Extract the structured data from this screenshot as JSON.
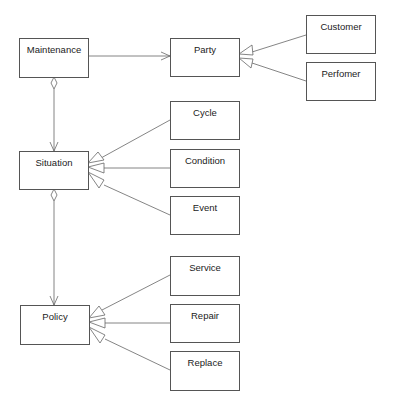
{
  "diagram": {
    "type": "UML class diagram",
    "classes": {
      "maintenance": {
        "label": "Maintenance"
      },
      "party": {
        "label": "Party"
      },
      "customer": {
        "label": "Customer"
      },
      "perfomer": {
        "label": "Perfomer"
      },
      "situation": {
        "label": "Situation"
      },
      "cycle": {
        "label": "Cycle"
      },
      "condition": {
        "label": "Condition"
      },
      "event": {
        "label": "Event"
      },
      "policy": {
        "label": "Policy"
      },
      "service": {
        "label": "Service"
      },
      "repair": {
        "label": "Repair"
      },
      "replace": {
        "label": "Replace"
      }
    },
    "relationships": [
      {
        "from": "Maintenance",
        "to": "Party",
        "kind": "association"
      },
      {
        "from": "Customer",
        "to": "Party",
        "kind": "generalization"
      },
      {
        "from": "Perfomer",
        "to": "Party",
        "kind": "generalization"
      },
      {
        "from": "Maintenance",
        "to": "Situation",
        "kind": "aggregation"
      },
      {
        "from": "Cycle",
        "to": "Situation",
        "kind": "generalization"
      },
      {
        "from": "Condition",
        "to": "Situation",
        "kind": "generalization"
      },
      {
        "from": "Event",
        "to": "Situation",
        "kind": "generalization"
      },
      {
        "from": "Situation",
        "to": "Policy",
        "kind": "aggregation"
      },
      {
        "from": "Service",
        "to": "Policy",
        "kind": "generalization"
      },
      {
        "from": "Repair",
        "to": "Policy",
        "kind": "generalization"
      },
      {
        "from": "Replace",
        "to": "Policy",
        "kind": "generalization"
      }
    ],
    "colors": {
      "line": "#555555",
      "text": "#222222",
      "background": "#ffffff"
    }
  }
}
